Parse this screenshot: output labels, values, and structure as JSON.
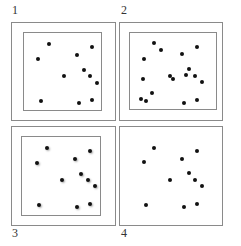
{
  "panels": [
    {
      "label": "1",
      "label_pos": [
        12,
        10
      ],
      "outer": [
        11,
        22,
        105,
        99
      ],
      "inner": [
        23,
        32,
        79,
        79
      ],
      "blurred": false,
      "dots": [
        [
          49,
          44
        ],
        [
          38,
          59
        ],
        [
          92,
          47
        ],
        [
          77,
          55
        ],
        [
          84,
          70
        ],
        [
          64,
          76
        ],
        [
          90,
          76
        ],
        [
          97,
          83
        ],
        [
          41,
          101
        ],
        [
          79,
          103
        ],
        [
          92,
          100
        ]
      ]
    },
    {
      "label": "2",
      "label_pos": [
        121,
        10
      ],
      "outer": [
        119,
        22,
        104,
        99
      ],
      "inner": [
        129,
        32,
        88,
        78
      ],
      "blurred": false,
      "dots": [
        [
          154,
          43
        ],
        [
          161,
          50
        ],
        [
          182,
          54
        ],
        [
          197,
          47
        ],
        [
          144,
          59
        ],
        [
          189,
          69
        ],
        [
          186,
          75
        ],
        [
          170,
          76
        ],
        [
          173,
          79
        ],
        [
          195,
          76
        ],
        [
          202,
          82
        ],
        [
          143,
          79
        ],
        [
          152,
          93
        ],
        [
          141,
          99
        ],
        [
          146,
          101
        ],
        [
          184,
          103
        ],
        [
          197,
          100
        ]
      ]
    },
    {
      "label": "3",
      "label_pos": [
        12,
        233
      ],
      "outer": [
        11,
        126,
        105,
        100
      ],
      "inner": [
        21,
        136,
        80,
        80
      ],
      "blurred": true,
      "dots": [
        [
          47,
          148
        ],
        [
          90,
          151
        ],
        [
          37,
          163
        ],
        [
          75,
          159
        ],
        [
          81,
          174
        ],
        [
          62,
          180
        ],
        [
          88,
          180
        ],
        [
          95,
          186
        ],
        [
          39,
          205
        ],
        [
          77,
          207
        ],
        [
          90,
          204
        ]
      ]
    },
    {
      "label": "4",
      "label_pos": [
        121,
        233
      ],
      "outer": [
        119,
        126,
        104,
        100
      ],
      "inner": null,
      "blurred": false,
      "dots": [
        [
          154,
          148
        ],
        [
          197,
          151
        ],
        [
          144,
          162
        ],
        [
          182,
          159
        ],
        [
          189,
          173
        ],
        [
          170,
          180
        ],
        [
          195,
          180
        ],
        [
          202,
          186
        ],
        [
          146,
          205
        ],
        [
          184,
          207
        ],
        [
          197,
          204
        ]
      ]
    }
  ]
}
